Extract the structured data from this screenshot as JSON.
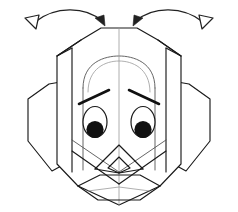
{
  "figure": {
    "background_color": "#ffffff",
    "width": 238,
    "height": 212,
    "line_color": "#1a1a1a",
    "thin_line_color": "#4a4a4a",
    "faint_line_color": "#9a9a9a",
    "pupil_color": "#111111"
  },
  "annotations": {
    "left_arrow": {
      "label": "fold-arrow-left",
      "direction": "inward-right",
      "tail_marker": "hollow-triangle",
      "head_marker": "solid-arrowhead"
    },
    "right_arrow": {
      "label": "fold-arrow-right",
      "direction": "inward-left",
      "tail_marker": "hollow-triangle",
      "head_marker": "solid-arrowhead"
    }
  },
  "face": {
    "head_outline": "M 72,40 L 96,27 L 142,27 L 166,40 L 166,78 L 190,96 L 190,152 L 166,174 L 142,196 L 119,203 L 96,196 L 72,174 L 48,152 L 48,96 L 72,78 Z",
    "left_ear_label": "left-ear-flap",
    "right_ear_label": "right-ear-flap",
    "center_crease_label": "center-vertical-crease",
    "snout_label": "snout-shape",
    "chin_label": "chin-panel"
  },
  "eyes": {
    "left": {
      "cx": 95,
      "cy": 122,
      "rx": 12,
      "ry": 15,
      "pupil_cx": 95,
      "pupil_cy": 129,
      "pupil_r": 8.5
    },
    "right": {
      "cx": 143,
      "cy": 122,
      "rx": 12,
      "ry": 15,
      "pupil_cx": 143,
      "pupil_cy": 129,
      "pupil_r": 8.5
    }
  },
  "brows": {
    "left": {
      "x1": 79,
      "y1": 103,
      "x2": 108,
      "y2": 90
    },
    "right": {
      "x1": 130,
      "y1": 90,
      "x2": 159,
      "y2": 103
    }
  }
}
